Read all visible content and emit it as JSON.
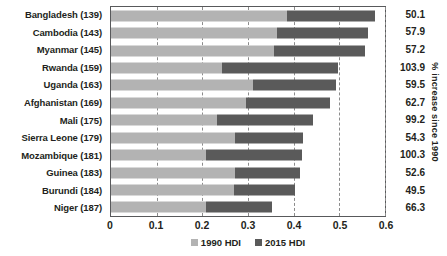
{
  "chart_data": {
    "type": "bar",
    "title": "",
    "subtitle": "",
    "xlabel": "",
    "ylabel": "",
    "xlim": [
      0,
      0.6
    ],
    "grid": true,
    "grid_orientation": "vertical",
    "legend_position": "bottom-center",
    "orientation": "horizontal",
    "x_tick_labels": [
      "0",
      "0.1",
      "0.2",
      "0.3",
      "0.4",
      "0.5",
      "0.6"
    ],
    "x_tick_values": [
      0,
      0.1,
      0.2,
      0.3,
      0.4,
      0.5,
      0.6
    ],
    "categories": [
      "Bangladesh (139)",
      "Cambodia (143)",
      "Myanmar (145)",
      "Rwanda (159)",
      "Uganda (163)",
      "Afghanistan (169)",
      "Mali (175)",
      "Sierra Leone (179)",
      "Mozambique (181)",
      "Guinea (183)",
      "Burundi (184)",
      "Niger (187)"
    ],
    "series": [
      {
        "name": "1990 HDI",
        "color": "#b3b3b3",
        "values": [
          0.386,
          0.364,
          0.358,
          0.244,
          0.31,
          0.295,
          0.232,
          0.271,
          0.209,
          0.271,
          0.27,
          0.208
        ]
      },
      {
        "name": "2015 HDI",
        "color": "#5a5a5a",
        "values": [
          0.579,
          0.563,
          0.556,
          0.498,
          0.493,
          0.479,
          0.442,
          0.42,
          0.418,
          0.414,
          0.404,
          0.353
        ]
      }
    ],
    "secondary_axis": {
      "title": "% increase since 1990",
      "values": [
        50.1,
        57.9,
        57.2,
        103.9,
        59.5,
        62.7,
        99.2,
        54.3,
        100.3,
        52.6,
        49.5,
        66.3
      ],
      "labels": [
        "50.1",
        "57.9",
        "57.2",
        "103.9",
        "59.5",
        "62.7",
        "99.2",
        "54.3",
        "100.3",
        "52.6",
        "49.5",
        "66.3"
      ]
    },
    "legend": [
      {
        "label": "1990 HDI",
        "color": "#b3b3b3"
      },
      {
        "label": "2015 HDI",
        "color": "#5a5a5a"
      }
    ]
  }
}
